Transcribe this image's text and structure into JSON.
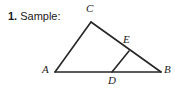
{
  "prompt": {
    "number": "1.",
    "text": "Sample:"
  },
  "figure": {
    "name": "triangle-diagram",
    "stroke_color": "#262626",
    "background_color": "#ffffff",
    "vertices": [
      {
        "id": "A",
        "label": "A",
        "x": 55,
        "y": 72
      },
      {
        "id": "B",
        "label": "B",
        "x": 161,
        "y": 72
      },
      {
        "id": "C",
        "label": "C",
        "x": 91,
        "y": 22
      },
      {
        "id": "D",
        "label": "D",
        "x": 112,
        "y": 72
      },
      {
        "id": "E",
        "label": "E",
        "x": 129,
        "y": 51
      }
    ],
    "segments": [
      {
        "from": "A",
        "to": "B"
      },
      {
        "from": "A",
        "to": "C"
      },
      {
        "from": "C",
        "to": "B"
      },
      {
        "from": "D",
        "to": "E"
      }
    ]
  }
}
